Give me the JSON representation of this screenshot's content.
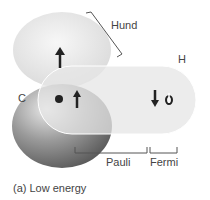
{
  "labels": {
    "hund": "Hund",
    "h": "H",
    "c": "C",
    "pauli": "Pauli",
    "fermi": "Fermi",
    "caption": "(a) Low energy"
  }
}
